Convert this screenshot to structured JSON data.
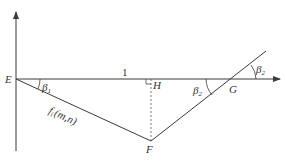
{
  "diagram": {
    "colors": {
      "line": "#3a3a3a",
      "text": "#333333",
      "background": "#ffffff"
    },
    "points": {
      "E": {
        "label": "E",
        "x": 16,
        "y": 79
      },
      "H": {
        "label": "H",
        "x": 151,
        "y": 79
      },
      "G": {
        "label": "G",
        "x": 232,
        "y": 79
      },
      "F": {
        "label": "F",
        "x": 151,
        "y": 141
      }
    },
    "segment_label": "1",
    "curve_label": {
      "f": "f",
      "sub": "i",
      "args": "(m,n)"
    },
    "angles": {
      "beta1": {
        "symbol": "β",
        "sub": "1"
      },
      "beta2_inner": {
        "symbol": "β",
        "sub": "2"
      },
      "beta2_outer": {
        "symbol": "β",
        "sub": "2"
      }
    }
  }
}
